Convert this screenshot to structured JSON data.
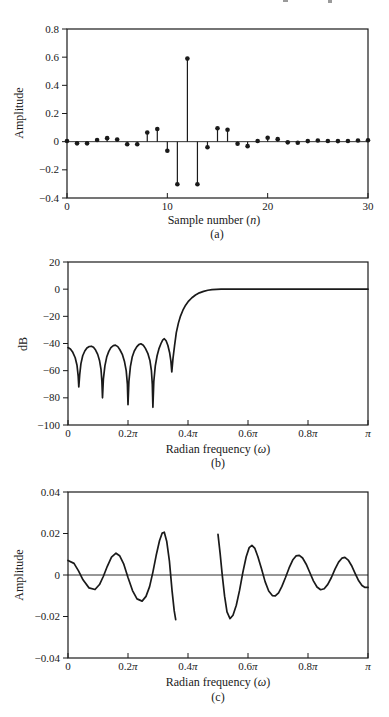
{
  "page": {
    "background": "#ffffff",
    "ink_color": "#1a1a1a"
  },
  "chart_data": [
    {
      "id": "a",
      "type": "stem",
      "caption": "(a)",
      "xlabel": "Sample number (n)",
      "ylabel": "Amplitude",
      "xlim": [
        0,
        30
      ],
      "ylim": [
        -0.4,
        0.8
      ],
      "xtick_values": [
        0,
        10,
        20,
        30
      ],
      "xtick_labels": [
        "0",
        "10",
        "20",
        "30"
      ],
      "ytick_values": [
        0.8,
        0.6,
        0.4,
        0.2,
        0,
        -0.2,
        -0.4
      ],
      "ytick_labels": [
        "0.8",
        "0.6",
        "0.4",
        "0.2",
        "0",
        "−0.2",
        "−0.4"
      ],
      "zero_line": true,
      "grid": false,
      "x": [
        0,
        1,
        2,
        3,
        4,
        5,
        6,
        7,
        8,
        9,
        10,
        11,
        12,
        13,
        14,
        15,
        16,
        17,
        18,
        19,
        20,
        21,
        22,
        23,
        24,
        25,
        26,
        27,
        28,
        29,
        30
      ],
      "y": [
        0.005,
        -0.012,
        -0.012,
        0.012,
        0.025,
        0.015,
        -0.018,
        -0.018,
        0.065,
        0.09,
        -0.065,
        -0.302,
        0.59,
        -0.302,
        -0.04,
        0.095,
        0.085,
        -0.015,
        -0.032,
        0.005,
        0.028,
        0.018,
        -0.005,
        -0.008,
        0.004,
        0.008,
        0.005,
        0.004,
        0.005,
        0.008,
        0.01
      ]
    },
    {
      "id": "b",
      "type": "line",
      "caption": "(b)",
      "xlabel": "Radian frequency (ω)",
      "ylabel": "dB",
      "x_unit": "multiples of π",
      "xlim": [
        0,
        1
      ],
      "ylim": [
        -100,
        20
      ],
      "xtick_values": [
        0,
        0.2,
        0.4,
        0.6,
        0.8,
        1
      ],
      "xtick_labels": [
        "0",
        "0.2π",
        "0.4π",
        "0.6π",
        "0.8π",
        "π"
      ],
      "ytick_values": [
        20,
        0,
        -20,
        -40,
        -60,
        -80,
        -100
      ],
      "ytick_labels": [
        "20",
        "0",
        "−20",
        "−40",
        "−60",
        "−80",
        "−100"
      ],
      "zero_line": false,
      "grid": false,
      "segments": [
        [
          [
            0,
            -43
          ],
          [
            0.008,
            -44
          ],
          [
            0.016,
            -46.5
          ],
          [
            0.024,
            -50.5
          ],
          [
            0.03,
            -56
          ],
          [
            0.034,
            -64
          ],
          [
            0.036,
            -72
          ],
          [
            0.039,
            -63
          ],
          [
            0.043,
            -55
          ],
          [
            0.049,
            -49
          ],
          [
            0.056,
            -45.5
          ],
          [
            0.063,
            -43.3
          ],
          [
            0.071,
            -42.2
          ],
          [
            0.078,
            -42
          ],
          [
            0.085,
            -42.8
          ],
          [
            0.092,
            -44.8
          ],
          [
            0.099,
            -48
          ],
          [
            0.105,
            -52.5
          ],
          [
            0.11,
            -59
          ],
          [
            0.113,
            -68
          ],
          [
            0.115,
            -80
          ],
          [
            0.118,
            -66
          ],
          [
            0.123,
            -56.5
          ],
          [
            0.129,
            -50
          ],
          [
            0.136,
            -45.8
          ],
          [
            0.143,
            -43
          ],
          [
            0.151,
            -41.6
          ],
          [
            0.158,
            -41.2
          ],
          [
            0.166,
            -42.3
          ],
          [
            0.173,
            -44.6
          ],
          [
            0.181,
            -48
          ],
          [
            0.188,
            -53
          ],
          [
            0.194,
            -60
          ],
          [
            0.198,
            -70
          ],
          [
            0.2,
            -85
          ],
          [
            0.203,
            -68
          ],
          [
            0.208,
            -57
          ],
          [
            0.214,
            -50
          ],
          [
            0.221,
            -45.5
          ],
          [
            0.229,
            -42.5
          ],
          [
            0.236,
            -40.8
          ],
          [
            0.243,
            -40.2
          ],
          [
            0.251,
            -41.3
          ],
          [
            0.258,
            -43.6
          ],
          [
            0.266,
            -47.2
          ],
          [
            0.273,
            -52.5
          ],
          [
            0.278,
            -60
          ],
          [
            0.281,
            -70
          ],
          [
            0.283,
            -87
          ],
          [
            0.286,
            -68
          ],
          [
            0.291,
            -56.5
          ],
          [
            0.297,
            -49
          ],
          [
            0.303,
            -44
          ],
          [
            0.31,
            -40
          ],
          [
            0.316,
            -37.3
          ],
          [
            0.321,
            -36.5
          ],
          [
            0.327,
            -38
          ],
          [
            0.333,
            -41.5
          ],
          [
            0.339,
            -47
          ],
          [
            0.343,
            -53
          ],
          [
            0.346,
            -61
          ],
          [
            0.35,
            -51
          ],
          [
            0.355,
            -42
          ],
          [
            0.361,
            -32
          ],
          [
            0.368,
            -25
          ],
          [
            0.375,
            -19.8
          ],
          [
            0.383,
            -15.5
          ],
          [
            0.392,
            -11.8
          ],
          [
            0.402,
            -8.8
          ],
          [
            0.413,
            -6.3
          ],
          [
            0.425,
            -4.3
          ],
          [
            0.438,
            -2.7
          ],
          [
            0.452,
            -1.6
          ],
          [
            0.466,
            -0.8
          ],
          [
            0.48,
            -0.35
          ],
          [
            0.495,
            -0.12
          ],
          [
            0.51,
            -0.03
          ],
          [
            0.53,
            0
          ],
          [
            0.6,
            0
          ],
          [
            0.7,
            0
          ],
          [
            0.8,
            0
          ],
          [
            0.9,
            0
          ],
          [
            1,
            0
          ]
        ]
      ]
    },
    {
      "id": "c",
      "type": "line",
      "caption": "(c)",
      "xlabel": "Radian frequency (ω)",
      "ylabel": "Amplitude",
      "x_unit": "multiples of π",
      "xlim": [
        0,
        1
      ],
      "ylim": [
        -0.04,
        0.04
      ],
      "xtick_values": [
        0,
        0.2,
        0.4,
        0.6,
        0.8,
        1
      ],
      "xtick_labels": [
        "0",
        "0.2π",
        "0.4π",
        "0.6π",
        "0.8π",
        "π"
      ],
      "ytick_values": [
        0.04,
        0.02,
        0,
        -0.02,
        -0.04
      ],
      "ytick_labels": [
        "0.04",
        "0.02",
        "0",
        "−0.02",
        "−0.04"
      ],
      "zero_line": true,
      "grid": false,
      "segments": [
        [
          [
            0,
            0.007
          ],
          [
            0.02,
            0.0056
          ],
          [
            0.035,
            0.002
          ],
          [
            0.05,
            -0.0023
          ],
          [
            0.07,
            -0.0062
          ],
          [
            0.09,
            -0.007
          ],
          [
            0.105,
            -0.0046
          ],
          [
            0.118,
            -0.0006
          ],
          [
            0.131,
            0.0042
          ],
          [
            0.145,
            0.0086
          ],
          [
            0.16,
            0.0105
          ],
          [
            0.172,
            0.0093
          ],
          [
            0.186,
            0.0052
          ],
          [
            0.2,
            -0.0012
          ],
          [
            0.215,
            -0.0075
          ],
          [
            0.23,
            -0.0115
          ],
          [
            0.247,
            -0.0126
          ],
          [
            0.26,
            -0.0103
          ],
          [
            0.272,
            -0.0056
          ],
          [
            0.283,
            0.0014
          ],
          [
            0.294,
            0.0095
          ],
          [
            0.305,
            0.0165
          ],
          [
            0.314,
            0.0202
          ],
          [
            0.321,
            0.0206
          ],
          [
            0.329,
            0.0163
          ],
          [
            0.338,
            0.0068
          ],
          [
            0.347,
            -0.0078
          ],
          [
            0.354,
            -0.0172
          ],
          [
            0.359,
            -0.0215
          ]
        ],
        [
          [
            0.5,
            0.0196
          ],
          [
            0.507,
            0.0105
          ],
          [
            0.514,
            0.0002
          ],
          [
            0.522,
            -0.0102
          ],
          [
            0.53,
            -0.0178
          ],
          [
            0.54,
            -0.021
          ],
          [
            0.55,
            -0.0194
          ],
          [
            0.561,
            -0.0146
          ],
          [
            0.572,
            -0.0073
          ],
          [
            0.583,
            0.0014
          ],
          [
            0.594,
            0.0088
          ],
          [
            0.604,
            0.0132
          ],
          [
            0.613,
            0.0143
          ],
          [
            0.623,
            0.0128
          ],
          [
            0.633,
            0.0088
          ],
          [
            0.645,
            0.003
          ],
          [
            0.657,
            -0.0032
          ],
          [
            0.669,
            -0.0077
          ],
          [
            0.681,
            -0.0099
          ],
          [
            0.691,
            -0.0101
          ],
          [
            0.702,
            -0.0086
          ],
          [
            0.713,
            -0.0055
          ],
          [
            0.725,
            -0.0012
          ],
          [
            0.737,
            0.0034
          ],
          [
            0.749,
            0.0072
          ],
          [
            0.76,
            0.0092
          ],
          [
            0.771,
            0.0095
          ],
          [
            0.782,
            0.0082
          ],
          [
            0.794,
            0.0052
          ],
          [
            0.806,
            0.0012
          ],
          [
            0.818,
            -0.0028
          ],
          [
            0.83,
            -0.0058
          ],
          [
            0.842,
            -0.0071
          ],
          [
            0.854,
            -0.0066
          ],
          [
            0.866,
            -0.0045
          ],
          [
            0.878,
            -0.0012
          ],
          [
            0.89,
            0.0028
          ],
          [
            0.902,
            0.0062
          ],
          [
            0.913,
            0.0081
          ],
          [
            0.923,
            0.0085
          ],
          [
            0.934,
            0.0072
          ],
          [
            0.945,
            0.0046
          ],
          [
            0.957,
            0.0008
          ],
          [
            0.969,
            -0.0028
          ],
          [
            0.98,
            -0.0051
          ],
          [
            0.99,
            -0.006
          ],
          [
            1,
            -0.006
          ]
        ]
      ]
    }
  ]
}
